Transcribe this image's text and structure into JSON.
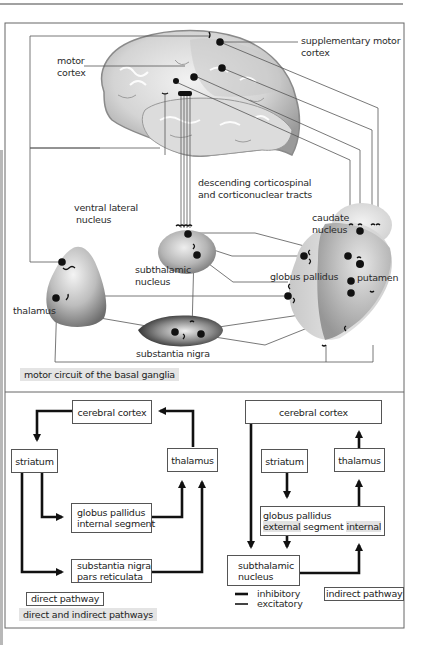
{
  "figure": {
    "top_panel": {
      "caption": "motor circuit of the basal ganglia",
      "labels": {
        "supplementary_motor_cortex_1": "supplementary motor",
        "supplementary_motor_cortex_2": "cortex",
        "motor_cortex_1": "motor",
        "motor_cortex_2": "cortex",
        "tracts_1": "descending corticospinal",
        "tracts_2": "and corticonuclear tracts",
        "ventral_lateral_1": "ventral lateral",
        "ventral_lateral_2": "nucleus",
        "thalamus": "thalamus",
        "subthalamic_1": "subthalamic",
        "subthalamic_2": "nucleus",
        "caudate_1": "caudate",
        "caudate_2": "nucleus",
        "globus_pallidus": "globus pallidus",
        "putamen": "putamen",
        "substantia_nigra": "substantia nigra"
      }
    },
    "bottom_panel": {
      "caption": "direct and indirect pathways",
      "direct": {
        "tag": "direct pathway",
        "cortex": "cerebral cortex",
        "striatum": "striatum",
        "thalamus": "thalamus",
        "gpi_1": "globus pallidus",
        "gpi_2": "internal segment",
        "snr_1": "substantia nigra",
        "snr_2": "pars reticulata"
      },
      "indirect": {
        "tag": "indirect pathway",
        "cortex": "cerebral cortex",
        "striatum": "striatum",
        "thalamus": "thalamus",
        "gp_1": "globus pallidus",
        "gp_external": "external",
        "gp_segment": "segment",
        "gp_internal": "internal",
        "stn_1": "subthalamic",
        "stn_2": "nucleus"
      },
      "legend": {
        "inhibitory": "inhibitory",
        "excitatory": "excitatory"
      }
    }
  }
}
